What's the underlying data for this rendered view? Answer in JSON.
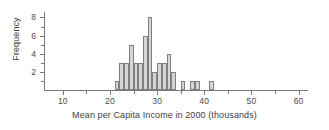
{
  "chart_data": {
    "type": "bar",
    "title": "",
    "subtitle": "",
    "xlabel": "Mean per Capita Income in 2000 (thousands)",
    "ylabel": "Frequency",
    "grid": false,
    "legend": null,
    "xlim": [
      6,
      62
    ],
    "ylim": [
      0,
      8.6
    ],
    "bin_width": 1,
    "x_ticks": [
      10,
      20,
      30,
      40,
      50,
      60
    ],
    "x_tick_labels": [
      "10",
      "20",
      "30",
      "40",
      "50",
      "60"
    ],
    "x_minor_ticks": [
      15,
      25,
      35,
      45,
      55
    ],
    "y_ticks": [
      2,
      4,
      6,
      8
    ],
    "y_tick_labels": [
      "2",
      "4",
      "6",
      "8"
    ],
    "y_minor_ticks": [
      1,
      3,
      5,
      7
    ],
    "bin_starts": [
      21,
      22,
      23,
      24,
      25,
      26,
      27,
      28,
      29,
      30,
      31,
      32,
      33,
      35,
      37,
      38,
      41
    ],
    "values": [
      1,
      3,
      3,
      5,
      3,
      3,
      6,
      8,
      2,
      3,
      3,
      4,
      2,
      1,
      1,
      1,
      1
    ],
    "bars": [
      {
        "x": 21,
        "value": 1
      },
      {
        "x": 22,
        "value": 3
      },
      {
        "x": 23,
        "value": 3
      },
      {
        "x": 24,
        "value": 5
      },
      {
        "x": 25,
        "value": 3
      },
      {
        "x": 26,
        "value": 3
      },
      {
        "x": 27,
        "value": 6
      },
      {
        "x": 28,
        "value": 8
      },
      {
        "x": 29,
        "value": 2
      },
      {
        "x": 30,
        "value": 3
      },
      {
        "x": 31,
        "value": 3
      },
      {
        "x": 32,
        "value": 4
      },
      {
        "x": 33,
        "value": 2
      },
      {
        "x": 35,
        "value": 1
      },
      {
        "x": 37,
        "value": 1
      },
      {
        "x": 38,
        "value": 1
      },
      {
        "x": 41,
        "value": 1
      }
    ],
    "colors": {
      "bar_fill": "#d6d6d6",
      "bar_edge": "#7e7f81",
      "axis": "#77787a",
      "text": "#3f4042",
      "background": "#ffffff"
    }
  }
}
